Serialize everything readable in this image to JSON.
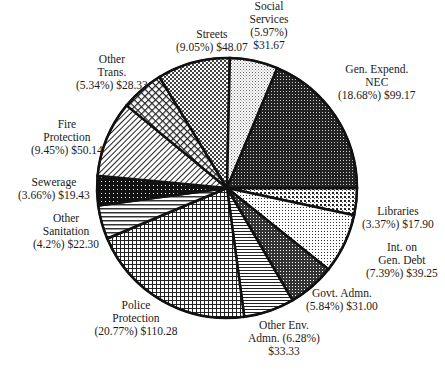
{
  "chart_data": {
    "type": "pie",
    "title": "",
    "unit": "$",
    "center": [
      227,
      188
    ],
    "radius": 130,
    "start_angle_deg": 0,
    "direction": "clockwise_from_east",
    "slices": [
      {
        "id": "libraries",
        "label": "Libraries",
        "percent": 3.37,
        "value": 17.9,
        "pattern": "dots-dark",
        "label_lines": [
          "Libraries",
          "(3.37%) $17.90"
        ],
        "label_pos": [
          398,
          205
        ]
      },
      {
        "id": "int-gen-debt",
        "label": "Int. on Gen. Debt",
        "percent": 7.39,
        "value": 39.25,
        "pattern": "fine-dots",
        "label_lines": [
          "Int. on",
          "Gen. Debt",
          "(7.39%) $39.25"
        ],
        "label_pos": [
          402,
          241
        ]
      },
      {
        "id": "govt-admn",
        "label": "Govt. Admn.",
        "percent": 5.84,
        "value": 31.0,
        "pattern": "dense-grid",
        "label_lines": [
          "Govt. Admn.",
          "(5.84%) $31.00"
        ],
        "label_pos": [
          342,
          287
        ]
      },
      {
        "id": "other-env-admn",
        "label": "Other Env. Admn.",
        "percent": 6.28,
        "value": 33.33,
        "pattern": "horizontal",
        "label_lines": [
          "Other Env.",
          "Admn. (6.28%)",
          "$33.33"
        ],
        "label_pos": [
          284,
          319
        ]
      },
      {
        "id": "police",
        "label": "Police Protection",
        "percent": 20.77,
        "value": 110.28,
        "pattern": "grid",
        "label_lines": [
          "Police",
          "Protection",
          "(20.77%) $110.28"
        ],
        "label_pos": [
          136,
          299
        ]
      },
      {
        "id": "other-sanitation",
        "label": "Other Sanitation",
        "percent": 4.2,
        "value": 22.3,
        "pattern": "horizontal-wide",
        "label_lines": [
          "Other",
          "Sanitation",
          "(4.2%) $22.30"
        ],
        "label_pos": [
          66,
          212
        ]
      },
      {
        "id": "sewerage",
        "label": "Sewerage",
        "percent": 3.66,
        "value": 19.43,
        "pattern": "black-dots",
        "label_lines": [
          "Sewerage",
          "(3.66%) $19.43"
        ],
        "label_pos": [
          54,
          176
        ]
      },
      {
        "id": "fire",
        "label": "Fire Protection",
        "percent": 9.45,
        "value": 50.14,
        "pattern": "diagonal",
        "label_lines": [
          "Fire",
          "Protection",
          "(9.45%) $50.14"
        ],
        "label_pos": [
          67,
          118
        ]
      },
      {
        "id": "other-trans",
        "label": "Other Trans.",
        "percent": 5.34,
        "value": 28.33,
        "pattern": "crosshatch",
        "label_lines": [
          "Other",
          "Trans.",
          "(5.34%) $28.33"
        ],
        "label_pos": [
          112,
          53
        ]
      },
      {
        "id": "streets",
        "label": "Streets",
        "percent": 9.05,
        "value": 48.07,
        "pattern": "checker",
        "label_lines": [
          "Streets",
          "(9.05%) $48.07"
        ],
        "label_pos": [
          212,
          28
        ]
      },
      {
        "id": "social-services",
        "label": "Social Services",
        "percent": 5.97,
        "value": 31.67,
        "pattern": "light-dots",
        "label_lines": [
          "Social",
          "Services",
          "(5.97%)",
          "$31.67"
        ],
        "label_pos": [
          269,
          0
        ]
      },
      {
        "id": "gen-expend-nec",
        "label": "Gen. Expend. NEC",
        "percent": 18.68,
        "value": 99.17,
        "pattern": "dark-dots",
        "label_lines": [
          "Gen. Expend.",
          "NEC",
          "(18.68%) $99.17"
        ],
        "label_pos": [
          377,
          63
        ]
      }
    ]
  }
}
